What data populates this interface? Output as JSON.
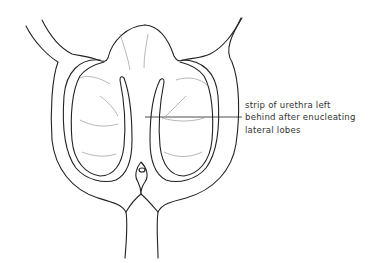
{
  "figure": {
    "type": "anatomical line illustration",
    "annotation": {
      "lines": [
        "strip of urethra left",
        "behind after enucleating",
        "lateral lobes"
      ]
    },
    "colors": {
      "line": "#222222",
      "hatch": "#888888",
      "background": "#ffffff"
    }
  }
}
